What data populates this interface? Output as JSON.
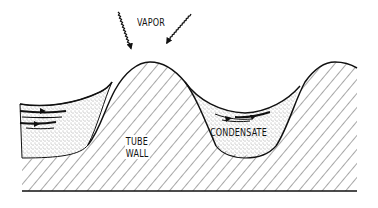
{
  "diagram": {
    "labels": {
      "vapor": "VAPOR",
      "tube_wall_line1": "TUBE",
      "tube_wall_line2": "WALL",
      "condensate": "CONDENSATE"
    },
    "regions": [
      {
        "name": "tube-wall",
        "fill": "diagonal-hatch"
      },
      {
        "name": "condensate-left",
        "fill": "stipple"
      },
      {
        "name": "condensate-middle",
        "fill": "stipple"
      }
    ],
    "arrows": [
      {
        "name": "vapor-arrow-left",
        "from": [
          118,
          12
        ],
        "to": [
          134,
          58
        ]
      },
      {
        "name": "vapor-arrow-right",
        "from": [
          191,
          14
        ],
        "to": [
          163,
          60
        ]
      }
    ],
    "colors": {
      "ink": "#111111",
      "background": "#ffffff"
    }
  }
}
